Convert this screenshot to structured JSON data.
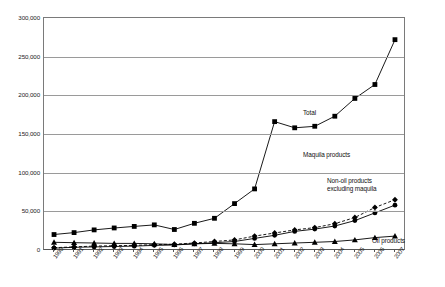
{
  "chart_data": {
    "type": "line",
    "title": "",
    "subtitle": "",
    "xlabel": "",
    "ylabel": "",
    "grid": true,
    "legend_position": "inline-annotations",
    "ylim": [
      0,
      300000
    ],
    "yticks": [
      "0",
      "50,000",
      "100,000",
      "150,000",
      "200,000",
      "250,000",
      "300,000"
    ],
    "ytick_values": [
      0,
      50000,
      100000,
      150000,
      200000,
      250000,
      300000
    ],
    "categories": [
      "1990",
      "1991",
      "1992",
      "1993",
      "1994",
      "1995",
      "1996",
      "1997",
      "1998",
      "1999",
      "2000",
      "2001",
      "2002",
      "2003",
      "2004",
      "2005",
      "2006",
      "2007"
    ],
    "x": [
      1990,
      1991,
      1992,
      1993,
      1994,
      1995,
      1996,
      1997,
      1998,
      1999,
      2000,
      2001,
      2002,
      2003,
      2004,
      2005,
      2006,
      2007
    ],
    "series": [
      {
        "name": "Total",
        "marker": "square",
        "dash": "solid",
        "color": "#000000",
        "values": [
          20000,
          23000,
          26000,
          28000,
          30000,
          32000,
          26000,
          34000,
          40000,
          48000,
          60000,
          79000,
          96000,
          110000,
          131000,
          166000,
          158000,
          160000
        ]
      },
      {
        "name": "Maquila products",
        "marker": "diamond",
        "dash": "dashed",
        "color": "#000000",
        "values": [
          3000,
          4000,
          5000,
          5500,
          6000,
          7000,
          7500,
          9000,
          11000,
          13000,
          18000,
          22000,
          26000,
          29000,
          34000,
          42000,
          55000,
          65000
        ]
      },
      {
        "name": "Non-oil products excluding maquila",
        "marker": "circle",
        "dash": "solid",
        "color": "#000000",
        "values": [
          2500,
          3500,
          4000,
          4500,
          5000,
          6000,
          6500,
          8000,
          9500,
          11000,
          15000,
          19000,
          24000,
          27000,
          31000,
          38000,
          48000,
          58000
        ]
      },
      {
        "name": "Oil products",
        "marker": "triangle",
        "dash": "solid",
        "color": "#000000",
        "values": [
          10000,
          9500,
          9000,
          8500,
          8500,
          8000,
          7000,
          8000,
          8500,
          8000,
          7000,
          8000,
          9000,
          10000,
          11000,
          13000,
          16000,
          18000
        ]
      }
    ],
    "series_full": [
      {
        "name": "Total",
        "values": [
          20000,
          22500,
          26000,
          28500,
          30500,
          32500,
          26500,
          34500,
          41000,
          48500,
          60500,
          79500,
          97000,
          110500,
          132000,
          166000,
          158500,
          160500,
          173000,
          196000,
          214000,
          250000,
          272000
        ]
      }
    ],
    "annotations": [
      {
        "text": "Total",
        "near_series": "Total"
      },
      {
        "text": "Maquila products",
        "near_series": "Maquila products"
      },
      {
        "text": "Non-oil products",
        "near_series": "Non-oil products excluding maquila"
      },
      {
        "text": "excluding maquila",
        "near_series": "Non-oil products excluding maquila"
      },
      {
        "text": "Oil products",
        "near_series": "Oil products"
      }
    ]
  },
  "annotation_labels": {
    "total": "Total",
    "maquila": "Maquila products",
    "nonoil_line1": "Non-oil products",
    "nonoil_line2": "excluding maquila",
    "oil": "Oil products"
  }
}
